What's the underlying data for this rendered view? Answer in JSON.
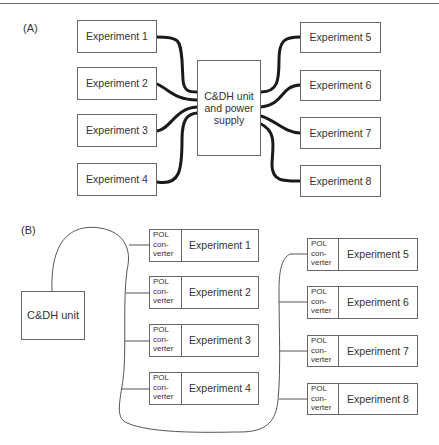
{
  "panel_a": {
    "label": "(A)",
    "hub": {
      "line1": "C&DH unit",
      "line2": "and power",
      "line3": "supply"
    },
    "experiments": [
      "Experiment 1",
      "Experiment 2",
      "Experiment 3",
      "Experiment 4",
      "Experiment 5",
      "Experiment 6",
      "Experiment 7",
      "Experiment 8"
    ]
  },
  "panel_b": {
    "label": "(B)",
    "hub": "C&DH unit",
    "pol": {
      "line1": "POL",
      "line2": "con-",
      "line3": "verter"
    },
    "experiments": [
      "Experiment 1",
      "Experiment 2",
      "Experiment 3",
      "Experiment 4",
      "Experiment 5",
      "Experiment 6",
      "Experiment 7",
      "Experiment 8"
    ]
  },
  "colors": {
    "line": "#666666",
    "cable": "#1a1a1a",
    "text": "#333333"
  }
}
